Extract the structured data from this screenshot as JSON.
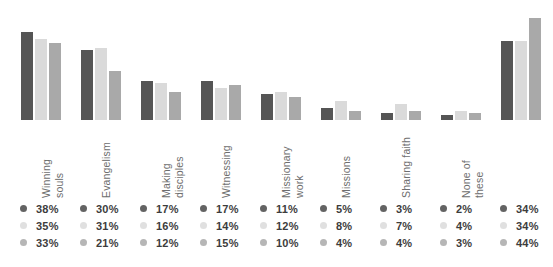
{
  "chart_data": {
    "type": "bar",
    "title": "",
    "xlabel": "",
    "ylabel": "",
    "ylim": [
      0,
      44
    ],
    "grid": false,
    "legend_position": "bottom",
    "categories": [
      "Convert",
      "Winning\nsouls",
      "Evangelism",
      "Making\ndisciples",
      "Witnessing",
      "Missionary\nwork",
      "Missions",
      "Sharing faith",
      "None of\nthese"
    ],
    "series": [
      {
        "name": "Series 1",
        "color": "#555555",
        "values": [
          38,
          30,
          17,
          17,
          11,
          5,
          3,
          2,
          34
        ],
        "labels": [
          "38%",
          "30%",
          "17%",
          "17%",
          "11%",
          "5%",
          "3%",
          "2%",
          "34%"
        ]
      },
      {
        "name": "Series 2",
        "color": "#dadada",
        "values": [
          35,
          31,
          16,
          14,
          12,
          8,
          7,
          4,
          34
        ],
        "labels": [
          "35%",
          "31%",
          "16%",
          "14%",
          "12%",
          "8%",
          "7%",
          "4%",
          "34%"
        ]
      },
      {
        "name": "Series 3",
        "color": "#a9a9a9",
        "values": [
          33,
          21,
          12,
          15,
          10,
          4,
          4,
          3,
          44
        ],
        "labels": [
          "33%",
          "21%",
          "12%",
          "15%",
          "10%",
          "4%",
          "4%",
          "3%",
          "44%"
        ]
      }
    ]
  }
}
